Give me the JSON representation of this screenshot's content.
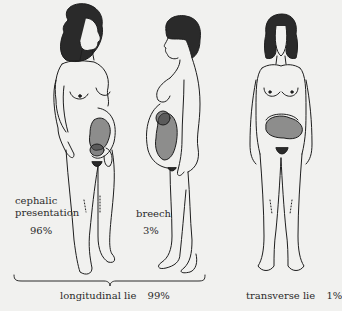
{
  "figure": {
    "figures": [
      {
        "id": "cephalic",
        "label_line1": "cephalic",
        "label_line2": "presentation",
        "percent": "96%"
      },
      {
        "id": "breech",
        "label": "breech",
        "percent": "3%"
      },
      {
        "id": "transverse",
        "label": "transverse lie",
        "percent": "1%"
      }
    ],
    "group": {
      "label": "longitudinal lie",
      "percent": "99%"
    }
  },
  "colors": {
    "background": "#f1f1ef",
    "line": "#1e1e1e",
    "hair": "#2a2a2a",
    "text": "#2b2b2b"
  }
}
